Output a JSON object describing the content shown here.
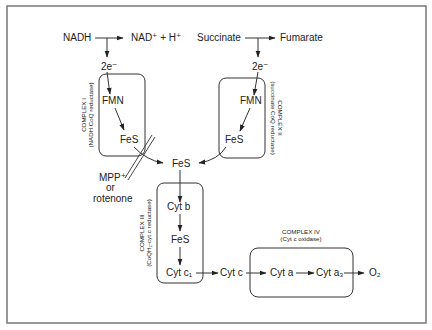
{
  "diagram": {
    "colors": {
      "line": "#333333",
      "frame": "#777777",
      "text": "#222222",
      "background": "#ffffff"
    },
    "inputs": {
      "nadh": "NADH",
      "nad_products": "NAD⁺ + H⁺",
      "succinate": "Succinate",
      "fumarate": "Fumarate",
      "electrons_1": "2e⁻",
      "electrons_2": "2e⁻"
    },
    "complex_1": {
      "name": "COMPLEX I",
      "subtitle": "(NADH CoQ reductase)",
      "components": [
        "FMN",
        "FeS"
      ]
    },
    "complex_2": {
      "name": "COMPLEX II",
      "subtitle": "(succinate CoQ reductase)",
      "components": [
        "FMN",
        "FeS"
      ]
    },
    "junction": {
      "label": "FeS"
    },
    "inhibitor": {
      "line1": "MPP⁺",
      "line2": "or",
      "line3": "rotenone"
    },
    "complex_3": {
      "name": "COMPLEX III",
      "subtitle": "(CoQH₂-cyt c reductase)",
      "components": [
        "Cyt b",
        "FeS",
        "Cyt c₁"
      ]
    },
    "cyt_c": "Cyt c",
    "complex_4": {
      "name": "COMPLEX IV",
      "subtitle": "(Cyt c oxidase)",
      "components": [
        "Cyt a",
        "Cyt a₃"
      ]
    },
    "final_acceptor": "O₂"
  }
}
